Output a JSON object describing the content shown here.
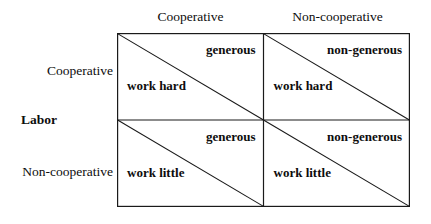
{
  "figure": {
    "type": "payoff-matrix",
    "axis_titles": {
      "row_axis": "Labor",
      "column_axis": ""
    },
    "column_headers": [
      "Cooperative",
      "Non-cooperative"
    ],
    "row_headers": [
      "Cooperative",
      "Non-cooperative"
    ],
    "cells": [
      [
        {
          "upper_right": "generous",
          "lower_left": "work hard"
        },
        {
          "upper_right": "non-generous",
          "lower_left": "work hard"
        }
      ],
      [
        {
          "upper_right": "generous",
          "lower_left": "work little"
        },
        {
          "upper_right": "non-generous",
          "lower_left": "work little"
        }
      ]
    ],
    "colors": {
      "background": "#ffffff",
      "line": "#1a1a1a",
      "text": "#0d0d0d"
    }
  }
}
